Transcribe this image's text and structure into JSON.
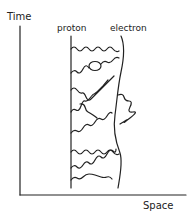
{
  "diagram": {
    "axes": {
      "y_label": "Time",
      "x_label": "Space"
    },
    "worldlines": [
      {
        "label": "proton",
        "style": "straight"
      },
      {
        "label": "electron",
        "style": "curved"
      }
    ],
    "exchanged_photons": {
      "count": 9,
      "style": "wavy"
    },
    "features": [
      "vacuum polarization loop on one exchanged photon",
      "electron self-energy photon emitted and reabsorbed on the right side of electron worldline"
    ],
    "colors": {
      "ink": "#222222",
      "background": "#ffffff"
    }
  }
}
